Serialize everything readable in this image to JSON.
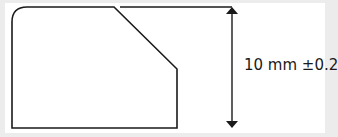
{
  "diagram": {
    "dimension_label": "10 mm ±0.2",
    "colors": {
      "background": "#ececec",
      "panel": "#ffffff",
      "stroke": "#1a1a1a"
    }
  }
}
